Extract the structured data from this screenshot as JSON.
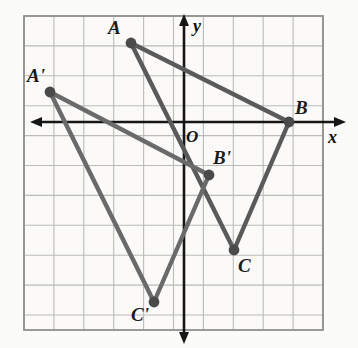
{
  "figure": {
    "kind": "coordinate-geometry-diagram",
    "background_color": "#fbfbfa",
    "grid_color": "#b9bcb8",
    "grid_border_color": "#8e918d",
    "axis_color": "#161616",
    "shape_color": "#5a5a5a",
    "vertex_color": "#4a4a4a",
    "grid": {
      "left": 24,
      "top": 16,
      "right": 323,
      "bottom": 330,
      "cell": 29.9,
      "columns": 10,
      "rows": 10.5
    },
    "axes": {
      "x_axis_y": 122,
      "y_axis_x": 184,
      "x_label": "x",
      "y_label": "y",
      "origin_label": "O"
    },
    "points": [
      {
        "id": "A",
        "label": "A",
        "px": 131,
        "py": 43,
        "label_x": 108,
        "label_y": 18,
        "grid_x": -1.77,
        "grid_y": 2.64
      },
      {
        "id": "B",
        "label": "B",
        "px": 289,
        "py": 122,
        "label_x": 295,
        "label_y": 98,
        "grid_x": 3.51,
        "grid_y": 0
      },
      {
        "id": "C",
        "label": "C",
        "px": 234,
        "py": 250,
        "label_x": 238,
        "label_y": 256,
        "grid_x": 1.67,
        "grid_y": -4.28
      },
      {
        "id": "Ap",
        "label": "A'",
        "px": 50,
        "py": 92,
        "label_x": 27,
        "label_y": 66,
        "grid_x": -4.48,
        "grid_y": 1.0
      },
      {
        "id": "Bp",
        "label": "B'",
        "px": 209,
        "py": 175,
        "label_x": 213,
        "label_y": 148,
        "grid_x": 0.84,
        "grid_y": -1.77
      },
      {
        "id": "Cp",
        "label": "C'",
        "px": 154,
        "py": 302,
        "label_x": 131,
        "label_y": 305,
        "grid_x": -1.0,
        "grid_y": -6.02
      }
    ],
    "triangles": [
      {
        "name": "triangle-ABC",
        "vertices": [
          "A",
          "B",
          "C"
        ]
      },
      {
        "name": "triangle-A'B'C'",
        "vertices": [
          "Ap",
          "Bp",
          "Cp"
        ]
      }
    ]
  }
}
